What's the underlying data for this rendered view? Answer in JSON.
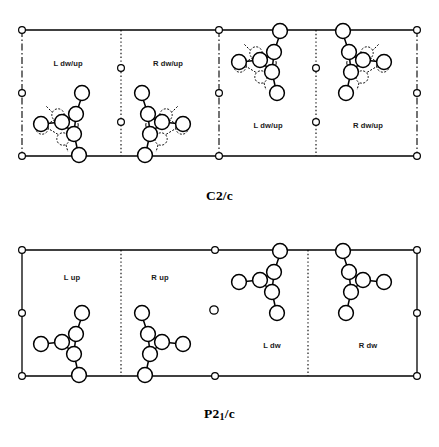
{
  "figure": {
    "type": "crystal-structure-packing-diagram",
    "background_color": "#ffffff",
    "line_color": "#000000"
  },
  "panels": [
    {
      "id": "panel-top",
      "space_group": "C2/c",
      "space_group_parts": {
        "prefix": "C2/c",
        "sub": "",
        "suffix": ""
      },
      "edge_style": "dash-dot",
      "divider_styles": [
        "dotted",
        "dash-dot",
        "dotted"
      ],
      "has_disorder": true,
      "molecules": [
        {
          "label": "L dw/up",
          "chirality": "L",
          "orientation": "dw/up",
          "disordered": true,
          "position": "lower-left",
          "label_x": 68,
          "label_y": 48
        },
        {
          "label": "R dw/up",
          "chirality": "R",
          "orientation": "dw/up",
          "disordered": true,
          "position": "lower-left",
          "label_x": 168,
          "label_y": 48
        },
        {
          "label": "L dw/up",
          "chirality": "L",
          "orientation": "dw/up",
          "disordered": true,
          "position": "upper-right",
          "label_x": 268,
          "label_y": 130
        },
        {
          "label": "R dw/up",
          "chirality": "R",
          "orientation": "dw/up",
          "disordered": true,
          "position": "upper-right",
          "label_x": 368,
          "label_y": 130
        }
      ]
    },
    {
      "id": "panel-bottom",
      "space_group": "P21/c",
      "space_group_parts": {
        "prefix": "P2",
        "sub": "1",
        "suffix": "/c"
      },
      "edge_style": "solid",
      "divider_styles": [
        "dotted",
        "none",
        "dotted"
      ],
      "has_disorder": false,
      "molecules": [
        {
          "label": "L up",
          "chirality": "L",
          "orientation": "up",
          "disordered": false,
          "position": "lower-left",
          "label_x": 72,
          "label_y": 40
        },
        {
          "label": "R up",
          "chirality": "R",
          "orientation": "up",
          "disordered": false,
          "position": "lower-left",
          "label_x": 160,
          "label_y": 40
        },
        {
          "label": "L dw",
          "chirality": "L",
          "orientation": "dw",
          "disordered": false,
          "position": "upper-right",
          "label_x": 272,
          "label_y": 122
        },
        {
          "label": "R dw",
          "chirality": "R",
          "orientation": "dw",
          "disordered": false,
          "position": "upper-right",
          "label_x": 368,
          "label_y": 122
        }
      ]
    }
  ]
}
